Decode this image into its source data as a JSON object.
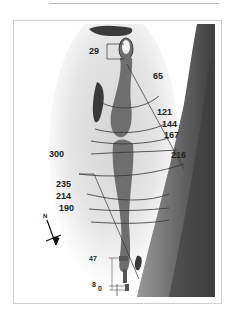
{
  "hole_map": {
    "colors": {
      "fairway": "#6e6e6e",
      "rough_light": "#e8e8e8",
      "water": "#7a7a7a",
      "water_dark": "#4a4a4a",
      "trees": "#3a3a3a",
      "lines": "#3a3a3a"
    },
    "green_markers": {
      "front_edge": "29"
    },
    "distance_labels": [
      {
        "id": "d65",
        "text": "65"
      },
      {
        "id": "d121",
        "text": "121"
      },
      {
        "id": "d144",
        "text": "144"
      },
      {
        "id": "d167",
        "text": "167"
      },
      {
        "id": "d216",
        "text": "216"
      },
      {
        "id": "d300",
        "text": "300"
      },
      {
        "id": "d235",
        "text": "235"
      },
      {
        "id": "d214",
        "text": "214"
      },
      {
        "id": "d190",
        "text": "190"
      }
    ],
    "tee_labels": [
      {
        "id": "t47",
        "text": "47"
      },
      {
        "id": "t8",
        "text": "8"
      },
      {
        "id": "t0",
        "text": "0"
      }
    ],
    "compass": {
      "label": "N"
    }
  }
}
